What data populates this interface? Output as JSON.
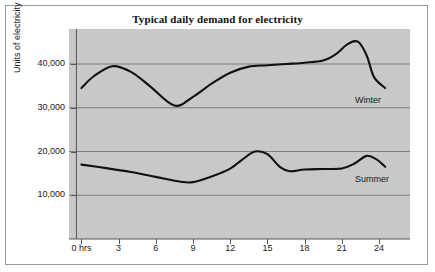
{
  "chart_data": {
    "type": "line",
    "title": "Typical daily demand for electricity",
    "xlabel": "",
    "ylabel": "Units of electricity",
    "xlim": [
      -1,
      26.5
    ],
    "ylim": [
      0,
      48000
    ],
    "grid": true,
    "legend_position": "inline-right",
    "x_tick_labels": [
      "0 hrs",
      "3",
      "6",
      "9",
      "12",
      "15",
      "18",
      "21",
      "24"
    ],
    "x_tick_values": [
      0,
      3,
      6,
      9,
      12,
      15,
      18,
      21,
      24
    ],
    "y_tick_labels": [
      "10,000",
      "20,000",
      "30,000",
      "40,000"
    ],
    "y_tick_values": [
      10000,
      20000,
      30000,
      40000
    ],
    "series": [
      {
        "name": "Winter",
        "label": "Winter",
        "color": "#111111",
        "x": [
          0,
          1,
          2.5,
          4,
          5.5,
          7.5,
          9,
          10.5,
          12,
          13.5,
          15,
          16.5,
          18,
          19.5,
          20.5,
          21.5,
          22.3,
          23,
          23.6,
          24.5
        ],
        "values": [
          34500,
          37200,
          39500,
          38200,
          35000,
          30500,
          32500,
          35500,
          38000,
          39400,
          39700,
          40000,
          40300,
          40800,
          42200,
          44600,
          45100,
          42000,
          37000,
          34500
        ]
      },
      {
        "name": "Summer",
        "label": "Summer",
        "color": "#111111",
        "x": [
          0,
          2,
          4,
          6,
          8,
          9,
          10.5,
          12,
          13,
          14,
          15,
          16,
          16.8,
          18,
          19.5,
          21,
          22,
          23,
          23.8,
          24.5
        ],
        "values": [
          17000,
          16200,
          15300,
          14200,
          13100,
          13000,
          14300,
          16100,
          18200,
          20000,
          19400,
          16500,
          15500,
          15900,
          16000,
          16100,
          17200,
          19000,
          18200,
          16500
        ]
      }
    ]
  }
}
